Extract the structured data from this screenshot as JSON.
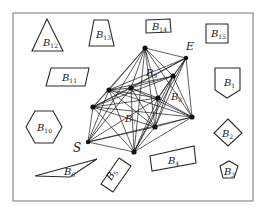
{
  "figure": {
    "type": "visibility-graph path planning diagram",
    "frame": {
      "x": 13,
      "y": 13,
      "width": 240,
      "height": 188,
      "stroke": "#8a8a8a"
    },
    "colors": {
      "stroke": "#2a2a2a",
      "edge": "#1a1a1a",
      "node": "#111111",
      "background": "#ffffff"
    }
  },
  "start": {
    "label": "S",
    "x": 88,
    "y": 142
  },
  "end": {
    "label": "E",
    "x": 186,
    "y": 58
  },
  "nodes": [
    {
      "id": "S",
      "x": 88,
      "y": 142
    },
    {
      "id": "E",
      "x": 186,
      "y": 58
    },
    {
      "id": "n1",
      "x": 145,
      "y": 48
    },
    {
      "id": "n2",
      "x": 93,
      "y": 107
    },
    {
      "id": "n3",
      "x": 109,
      "y": 90
    },
    {
      "id": "n4",
      "x": 131,
      "y": 88
    },
    {
      "id": "n5",
      "x": 134,
      "y": 152
    },
    {
      "id": "n6",
      "x": 155,
      "y": 127
    },
    {
      "id": "n7",
      "x": 192,
      "y": 117
    },
    {
      "id": "n8",
      "x": 173,
      "y": 76
    },
    {
      "id": "n9",
      "x": 158,
      "y": 98
    }
  ],
  "obstacles": [
    {
      "id": "B1",
      "base": "B",
      "sub": "1",
      "shape": "pentagon-shield",
      "points": "215,68 240,68 240,90 227,98 215,90",
      "label_x": 224,
      "label_y": 86
    },
    {
      "id": "B2",
      "base": "B",
      "sub": "2",
      "shape": "diamond",
      "points": "228,119 242,133 228,146 214,133",
      "label_x": 222,
      "label_y": 137
    },
    {
      "id": "B3",
      "base": "B",
      "sub": "3",
      "shape": "pentagon",
      "points": "220,166 229,161 238,166 234,178 223,178",
      "label_x": 224,
      "label_y": 175
    },
    {
      "id": "B4",
      "base": "B",
      "sub": "4",
      "shape": "rotated-rectangle",
      "points": "150,156 194,146 196,163 152,171",
      "label_x": 168,
      "label_y": 164
    },
    {
      "id": "B5",
      "base": "B",
      "sub": "5",
      "shape": "rotated-rectangle",
      "points": "119,158 131,166 113,192 101,184",
      "label_x": 111,
      "label_y": 181
    },
    {
      "id": "B6",
      "base": "B",
      "sub": "6",
      "shape": "thin-triangle",
      "points": "35,176 97,159 70,177",
      "label_x": 64,
      "label_y": 175
    },
    {
      "id": "B7",
      "base": "B",
      "sub": "7",
      "shape": "label-only",
      "points": "",
      "label_x": 125,
      "label_y": 122
    },
    {
      "id": "B8",
      "base": "B",
      "sub": "8",
      "shape": "label-only",
      "points": "",
      "label_x": 171,
      "label_y": 100
    },
    {
      "id": "B9",
      "base": "B",
      "sub": "9",
      "shape": "label-only",
      "points": "",
      "label_x": 146,
      "label_y": 76
    },
    {
      "id": "B10",
      "base": "B",
      "sub": "10",
      "shape": "hexagon",
      "points": "26,127 35,111 53,111 62,127 53,143 35,143",
      "label_x": 37,
      "label_y": 131
    },
    {
      "id": "B11",
      "base": "B",
      "sub": "11",
      "shape": "parallelogram",
      "points": "51,68 89,68 85,86 46,86",
      "label_x": 62,
      "label_y": 81
    },
    {
      "id": "B12",
      "base": "B",
      "sub": "12",
      "shape": "triangle",
      "points": "47,19 63,51 32,51",
      "label_x": 43,
      "label_y": 46
    },
    {
      "id": "B13",
      "base": "B",
      "sub": "13",
      "shape": "trapezoid",
      "points": "94,20 108,20 114,46 89,46",
      "label_x": 96,
      "label_y": 38
    },
    {
      "id": "B14",
      "base": "B",
      "sub": "14",
      "shape": "rectangle",
      "points": "146,20 170,19 171,32 146,33",
      "label_x": 152,
      "label_y": 30
    },
    {
      "id": "B15",
      "base": "B",
      "sub": "15",
      "shape": "rectangle",
      "points": "206,24 228,24 228,43 206,43",
      "label_x": 211,
      "label_y": 37
    }
  ],
  "edges": [
    [
      "S",
      "n2"
    ],
    [
      "S",
      "n3"
    ],
    [
      "S",
      "n4"
    ],
    [
      "S",
      "n5"
    ],
    [
      "S",
      "n6"
    ],
    [
      "S",
      "n7"
    ],
    [
      "S",
      "n9"
    ],
    [
      "S",
      "n1"
    ],
    [
      "n2",
      "n3"
    ],
    [
      "n2",
      "n4"
    ],
    [
      "n2",
      "n1"
    ],
    [
      "n2",
      "E"
    ],
    [
      "n2",
      "n8"
    ],
    [
      "n2",
      "n9"
    ],
    [
      "n2",
      "n6"
    ],
    [
      "n2",
      "n5"
    ],
    [
      "n2",
      "n7"
    ],
    [
      "n3",
      "n4"
    ],
    [
      "n3",
      "n1"
    ],
    [
      "n3",
      "E"
    ],
    [
      "n3",
      "n8"
    ],
    [
      "n3",
      "n9"
    ],
    [
      "n3",
      "n6"
    ],
    [
      "n3",
      "n5"
    ],
    [
      "n3",
      "n7"
    ],
    [
      "n4",
      "n1"
    ],
    [
      "n4",
      "E"
    ],
    [
      "n4",
      "n8"
    ],
    [
      "n4",
      "n9"
    ],
    [
      "n4",
      "n6"
    ],
    [
      "n4",
      "n5"
    ],
    [
      "n4",
      "n7"
    ],
    [
      "n1",
      "E"
    ],
    [
      "n1",
      "n8"
    ],
    [
      "n1",
      "n9"
    ],
    [
      "n1",
      "n6"
    ],
    [
      "n1",
      "n5"
    ],
    [
      "n1",
      "n7"
    ],
    [
      "E",
      "n8"
    ],
    [
      "E",
      "n9"
    ],
    [
      "E",
      "n6"
    ],
    [
      "E",
      "n5"
    ],
    [
      "E",
      "n7"
    ],
    [
      "n8",
      "n9"
    ],
    [
      "n8",
      "n6"
    ],
    [
      "n8",
      "n5"
    ],
    [
      "n8",
      "n7"
    ],
    [
      "n9",
      "n6"
    ],
    [
      "n9",
      "n5"
    ],
    [
      "n9",
      "n7"
    ],
    [
      "n6",
      "n5"
    ],
    [
      "n6",
      "n7"
    ],
    [
      "n5",
      "n7"
    ]
  ]
}
